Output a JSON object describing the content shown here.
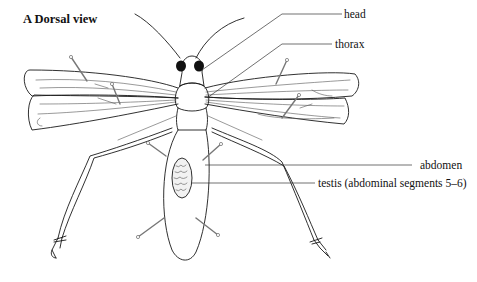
{
  "figure": {
    "title": "A Dorsal view",
    "labels": [
      {
        "id": "head",
        "text": "head"
      },
      {
        "id": "thorax",
        "text": "thorax"
      },
      {
        "id": "abdomen",
        "text": "abdomen"
      },
      {
        "id": "testis",
        "text": "testis (abdominal segments 5–6)"
      }
    ],
    "colors": {
      "ink": "#1a1a1a",
      "background": "#ffffff",
      "pins": "#777777"
    }
  }
}
